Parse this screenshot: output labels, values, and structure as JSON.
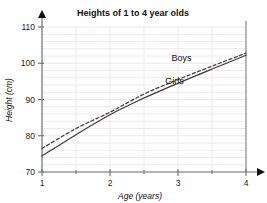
{
  "chart_data": {
    "type": "line",
    "title": "Heights of 1 to 4 year olds",
    "xlabel": "Age (years)",
    "ylabel": "Height (cm)",
    "xlim": [
      1,
      4
    ],
    "ylim": [
      70,
      110
    ],
    "x_ticks": [
      "1",
      "2",
      "3",
      "4"
    ],
    "y_ticks": [
      "70",
      "80",
      "90",
      "100",
      "110"
    ],
    "x_tick_values": [
      1,
      2,
      3,
      4
    ],
    "y_tick_values": [
      70,
      80,
      90,
      100,
      110
    ],
    "x_minor_ticks": [
      1.5,
      2.5,
      3.5
    ],
    "grid": true,
    "grid_axis": "y",
    "legend": "inline-labels",
    "axis_arrows": true,
    "x": [
      1,
      1.5,
      2,
      2.5,
      3,
      3.5,
      4
    ],
    "series": [
      {
        "name": "Boys",
        "style": "dashed",
        "color": "#3a3a3a",
        "values": [
          76.5,
          82.0,
          86.5,
          91.5,
          95.5,
          99.2,
          102.8
        ],
        "label_x": 3.05,
        "label_y": 100.7
      },
      {
        "name": "Girls",
        "style": "solid",
        "color": "#3a3a3a",
        "values": [
          74.4,
          80.3,
          85.8,
          90.4,
          94.5,
          98.4,
          102.2
        ],
        "label_x": 2.95,
        "label_y": 94.3
      }
    ],
    "colors": {
      "axis": "#6e6e6e",
      "grid": "#f0e8ea",
      "line": "#3a3a3a",
      "text": "#111111",
      "background": "#ffffff"
    }
  }
}
